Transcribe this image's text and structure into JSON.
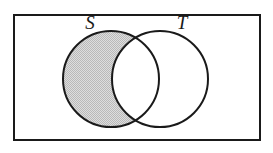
{
  "figure": {
    "name": "venn-diagram",
    "background_color": "#ffffff"
  },
  "universe": {
    "name": "universal-set-rectangle",
    "stroke_color": "#1a1a1a",
    "fill_color": "#ffffff",
    "stroke_width": 2,
    "x": 14,
    "y": 15,
    "width": 246,
    "height": 125
  },
  "sets": [
    {
      "id": "S",
      "label": "S",
      "label_x": 90,
      "label_y": 29,
      "circle_cx": 111,
      "circle_cy": 79,
      "circle_r": 48,
      "stroke_color": "#1a1a1a",
      "fill_color": "#ffffff",
      "stroke_width": 2
    },
    {
      "id": "T",
      "label": "T",
      "label_x": 182,
      "label_y": 29,
      "circle_cx": 160,
      "circle_cy": 79,
      "circle_r": 48,
      "stroke_color": "#1a1a1a",
      "fill_color": "#ffffff",
      "stroke_width": 2
    }
  ],
  "shaded_region": {
    "name": "s-minus-t-region",
    "description": "S excluding T (set difference) is shaded",
    "fill_color": "#cfcfcf",
    "pattern": "dither",
    "shaded": true
  },
  "unshaded_regions": [
    {
      "name": "s-intersect-t-region",
      "description": "intersection lens",
      "shaded": false
    },
    {
      "name": "t-minus-s-region",
      "description": "T excluding S",
      "shaded": false
    },
    {
      "name": "outside-region",
      "description": "complement inside rectangle",
      "shaded": false
    }
  ]
}
